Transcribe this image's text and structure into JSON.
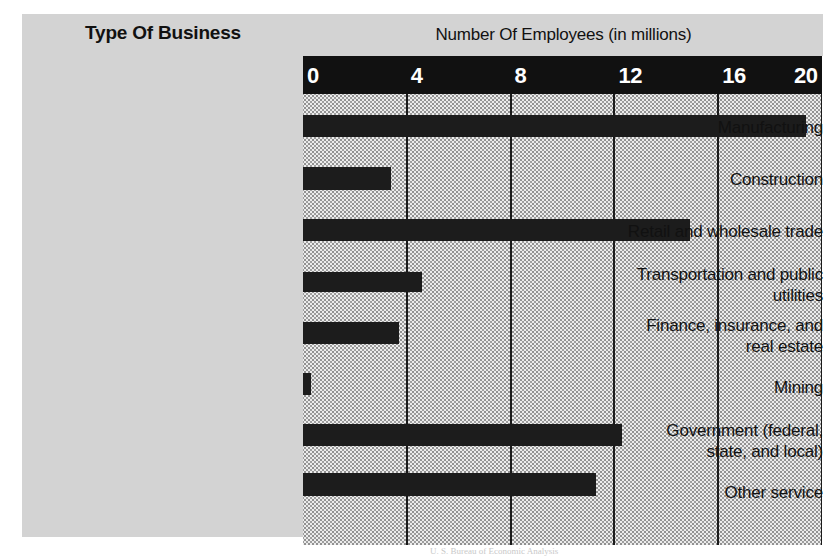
{
  "titles": {
    "left": "Type Of Business",
    "right": "Number Of Employees (in millions)"
  },
  "source_note": "U. S. Bureau of Economic Analysis",
  "chart_data": {
    "type": "bar",
    "orientation": "horizontal",
    "title": "Number Of Employees (in millions)",
    "xlabel": "Number Of Employees (in millions)",
    "ylabel": "Type Of Business",
    "xlim": [
      0,
      20
    ],
    "xticks": [
      0,
      4,
      8,
      12,
      16,
      20
    ],
    "xtick_labels": [
      "0",
      "4",
      "8",
      "12",
      "16",
      "20"
    ],
    "grid": true,
    "grid_axis": "x",
    "legend": "none",
    "bar_color": "#1c1c1c",
    "plot_background": "#ececec",
    "axis_strip_color": "#111111",
    "panel_color": "#d3d3d3",
    "categories": [
      "Manufacturing",
      "Construction",
      "Retail and wholesale trade",
      "Transportation and public utilities",
      "Finance, insurance, and real estate",
      "Mining",
      "Government (federal, state, and local)",
      "Other service"
    ],
    "values": [
      19.4,
      3.4,
      14.9,
      4.6,
      3.7,
      0.3,
      12.3,
      11.3
    ]
  },
  "categories": [
    {
      "label_lines": [
        "Manufacturing"
      ],
      "value": 19.4
    },
    {
      "label_lines": [
        "Construction"
      ],
      "value": 3.4
    },
    {
      "label_lines": [
        "Retail and wholesale trade"
      ],
      "value": 14.9
    },
    {
      "label_lines": [
        "Transportation and public",
        "utilities"
      ],
      "value": 4.6
    },
    {
      "label_lines": [
        "Finance, insurance, and",
        "real estate"
      ],
      "value": 3.7
    },
    {
      "label_lines": [
        "Mining"
      ],
      "value": 0.3
    },
    {
      "label_lines": [
        "Government (federal,",
        "state, and local)"
      ],
      "value": 12.3
    },
    {
      "label_lines": [
        "Other service"
      ],
      "value": 11.3
    }
  ]
}
